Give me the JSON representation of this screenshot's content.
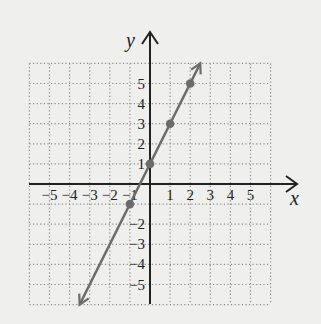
{
  "chart_data": {
    "type": "line",
    "title": "",
    "xlabel": "x",
    "ylabel": "y",
    "xlim": [
      -6,
      6
    ],
    "ylim": [
      -6,
      6
    ],
    "grid": true,
    "grid_style": "dotted",
    "x_ticks": [
      -5,
      -4,
      -3,
      -2,
      -1,
      1,
      2,
      3,
      4,
      5
    ],
    "y_ticks": [
      -5,
      -4,
      -3,
      -2,
      1,
      2,
      3,
      4,
      5
    ],
    "x_tick_labels": [
      "−5",
      "−4",
      "−3",
      "−2",
      "−1",
      "1",
      "2",
      "3",
      "4",
      "5"
    ],
    "y_tick_labels": [
      "−5",
      "−4",
      "−3",
      "−2",
      "1",
      "2",
      "3",
      "4",
      "5"
    ],
    "series": [
      {
        "name": "y = 2x + 1",
        "kind": "line-with-arrows",
        "color": "#6b6b6b",
        "endpoints": [
          [
            -3.5,
            -6
          ],
          [
            2.5,
            6
          ]
        ],
        "points": [
          [
            -1,
            -1
          ],
          [
            0,
            1
          ],
          [
            1,
            3
          ],
          [
            2,
            5
          ]
        ]
      }
    ]
  },
  "labels": {
    "x_axis": "x",
    "y_axis": "y"
  },
  "colors": {
    "background": "#efefed",
    "axis": "#222222",
    "grid": "#8a8a8a",
    "line": "#6b6b6b"
  }
}
